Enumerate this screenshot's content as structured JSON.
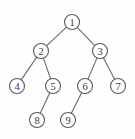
{
  "figure": {
    "background_color": "#fefefe",
    "node_fill": "#ffffff",
    "node_stroke": "#5a5a5a",
    "edge_stroke": "#6f6f6f",
    "label_color": "#3a3a3a"
  },
  "chart_data": {
    "type": "diagram",
    "diagram_kind": "binary-tree",
    "title": "",
    "node_radius": 7.5,
    "nodes": [
      {
        "id": "n1",
        "label": "1",
        "x": 72,
        "y": 22,
        "level": 0
      },
      {
        "id": "n2",
        "label": "2",
        "x": 41,
        "y": 51,
        "level": 1
      },
      {
        "id": "n3",
        "label": "3",
        "x": 100,
        "y": 51,
        "level": 1
      },
      {
        "id": "n4",
        "label": "4",
        "x": 17,
        "y": 86,
        "level": 2
      },
      {
        "id": "n5",
        "label": "5",
        "x": 53,
        "y": 86,
        "level": 2
      },
      {
        "id": "n6",
        "label": "6",
        "x": 85,
        "y": 86,
        "level": 2
      },
      {
        "id": "n7",
        "label": "7",
        "x": 118,
        "y": 86,
        "level": 2
      },
      {
        "id": "n8",
        "label": "8",
        "x": 37,
        "y": 120,
        "level": 3
      },
      {
        "id": "n9",
        "label": "9",
        "x": 68,
        "y": 120,
        "level": 3
      }
    ],
    "edges": [
      {
        "from": "n1",
        "to": "n2",
        "side": "left"
      },
      {
        "from": "n1",
        "to": "n3",
        "side": "right"
      },
      {
        "from": "n2",
        "to": "n4",
        "side": "left"
      },
      {
        "from": "n2",
        "to": "n5",
        "side": "right"
      },
      {
        "from": "n3",
        "to": "n6",
        "side": "left"
      },
      {
        "from": "n3",
        "to": "n7",
        "side": "right"
      },
      {
        "from": "n5",
        "to": "n8",
        "side": "left"
      },
      {
        "from": "n6",
        "to": "n9",
        "side": "left"
      }
    ]
  }
}
